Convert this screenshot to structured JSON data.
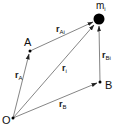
{
  "diagram": {
    "points": {
      "O": {
        "label": "O",
        "x": 13,
        "y": 118
      },
      "A": {
        "label": "A",
        "x": 30,
        "y": 51
      },
      "B": {
        "label": "B",
        "x": 100,
        "y": 82
      },
      "m": {
        "label": "m",
        "sub": "i",
        "x": 99,
        "y": 19
      }
    },
    "vectors": {
      "rA": {
        "symbol": "r",
        "sub": "A"
      },
      "rAi": {
        "symbol": "r",
        "sub": "Ai"
      },
      "ri": {
        "symbol": "r",
        "sub": "i"
      },
      "rBi": {
        "symbol": "r",
        "sub": "Bi"
      },
      "rB": {
        "symbol": "r",
        "sub": "B"
      }
    },
    "colors": {
      "line": "#555555",
      "point": "#000000",
      "mass": "#000000"
    }
  }
}
